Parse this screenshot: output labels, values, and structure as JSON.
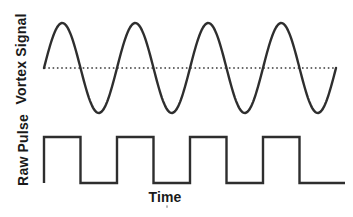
{
  "labels": {
    "vortex_signal": "Vortex Signal",
    "raw_pulse": "Raw Pulse",
    "time_axis": "Time"
  },
  "colors": {
    "stroke": "#2e2e2e",
    "baseline": "#3a3a3a",
    "text": "#1a1a1a",
    "background": "#ffffff"
  },
  "chart_data": {
    "type": "line",
    "title": "",
    "xlabel": "Time",
    "ylabel": "",
    "x_ticks": [],
    "y_ticks": [],
    "grid": false,
    "legend": false,
    "panels": [
      {
        "label": "Vortex Signal",
        "waveform": "sine",
        "cycles": 4,
        "amplitude": 1,
        "offset": 0,
        "start_phase_deg": 0,
        "baseline": {
          "value": 0,
          "style": "dotted"
        }
      },
      {
        "label": "Raw Pulse",
        "waveform": "square",
        "pulses": 4,
        "duty_cycle": 0.5,
        "low_level": 0,
        "high_level": 1,
        "alignment": "high while Vortex Signal is positive"
      }
    ]
  }
}
